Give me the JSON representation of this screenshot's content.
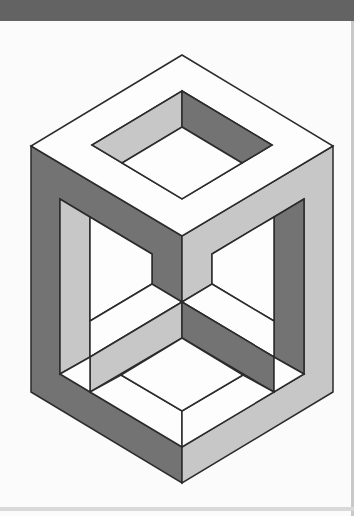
{
  "canvas": {
    "width": 354,
    "height": 516,
    "background": "#fbfbfb"
  },
  "top_bar": {
    "color": "#636363",
    "height": 21
  },
  "scan_artifacts": {
    "right_strip_color": "#c9c9c9",
    "bottom_strip_color": "#d9d9d9"
  },
  "palette": {
    "white": "#fdfdfd",
    "light": "#c7c7c7",
    "dark": "#737373",
    "stroke": "#2b2b2b",
    "stroke_width": 1.5
  },
  "shapes": [
    {
      "name": "left-outer-face",
      "fill": "dark",
      "points": [
        [
          31,
          146
        ],
        [
          182,
          236
        ],
        [
          182,
          302
        ],
        [
          152,
          284
        ],
        [
          152,
          254
        ],
        [
          60,
          199
        ],
        [
          60,
          374
        ],
        [
          182,
          447
        ],
        [
          182,
          483
        ],
        [
          31,
          392
        ]
      ]
    },
    {
      "name": "right-outer-face",
      "fill": "light",
      "points": [
        [
          333,
          146
        ],
        [
          182,
          236
        ],
        [
          182,
          302
        ],
        [
          212,
          284
        ],
        [
          212,
          254
        ],
        [
          304,
          199
        ],
        [
          304,
          374
        ],
        [
          182,
          447
        ],
        [
          182,
          483
        ],
        [
          333,
          392
        ]
      ]
    },
    {
      "name": "top-face-ring",
      "fill": "white",
      "points": [
        [
          182,
          55
        ],
        [
          333,
          146
        ],
        [
          182,
          236
        ],
        [
          31,
          146
        ]
      ],
      "hole": [
        [
          182,
          91
        ],
        [
          272,
          145
        ],
        [
          182,
          199
        ],
        [
          92,
          145
        ]
      ]
    },
    {
      "name": "hole-left-inner-wall",
      "fill": "light",
      "points": [
        [
          182,
          91
        ],
        [
          92,
          145
        ],
        [
          122,
          163
        ],
        [
          182,
          127
        ]
      ]
    },
    {
      "name": "hole-right-inner-wall",
      "fill": "dark",
      "points": [
        [
          182,
          91
        ],
        [
          272,
          145
        ],
        [
          242,
          163
        ],
        [
          182,
          127
        ]
      ]
    },
    {
      "name": "hole-floor-opening",
      "fill": "white",
      "points": [
        [
          182,
          127
        ],
        [
          242,
          163
        ],
        [
          182,
          199
        ],
        [
          122,
          163
        ]
      ]
    },
    {
      "name": "left-inner-wall",
      "fill": "light",
      "points": [
        [
          60,
          199
        ],
        [
          90,
          217
        ],
        [
          90,
          357
        ],
        [
          60,
          374
        ]
      ]
    },
    {
      "name": "right-inner-wall",
      "fill": "dark",
      "points": [
        [
          304,
          199
        ],
        [
          274,
          217
        ],
        [
          274,
          357
        ],
        [
          304,
          374
        ]
      ]
    },
    {
      "name": "left-window",
      "fill": "white",
      "points": [
        [
          90,
          217
        ],
        [
          152,
          254
        ],
        [
          152,
          284
        ],
        [
          90,
          321
        ]
      ]
    },
    {
      "name": "right-window",
      "fill": "white",
      "points": [
        [
          274,
          217
        ],
        [
          212,
          254
        ],
        [
          212,
          284
        ],
        [
          274,
          321
        ]
      ]
    },
    {
      "name": "left-mid-face",
      "fill": "white",
      "points": [
        [
          152,
          284
        ],
        [
          90,
          321
        ],
        [
          90,
          357
        ],
        [
          182,
          302
        ]
      ]
    },
    {
      "name": "right-mid-face",
      "fill": "white",
      "points": [
        [
          212,
          284
        ],
        [
          274,
          321
        ],
        [
          274,
          357
        ],
        [
          182,
          302
        ]
      ]
    },
    {
      "name": "left-lower-band",
      "fill": "light",
      "points": [
        [
          182,
          302
        ],
        [
          90,
          357
        ],
        [
          90,
          392
        ],
        [
          182,
          338
        ]
      ]
    },
    {
      "name": "right-lower-band",
      "fill": "dark",
      "points": [
        [
          182,
          302
        ],
        [
          274,
          357
        ],
        [
          274,
          392
        ],
        [
          182,
          338
        ]
      ]
    },
    {
      "name": "left-wedge",
      "fill": "white",
      "points": [
        [
          60,
          374
        ],
        [
          90,
          357
        ],
        [
          90,
          392
        ]
      ]
    },
    {
      "name": "right-wedge",
      "fill": "white",
      "points": [
        [
          304,
          374
        ],
        [
          274,
          357
        ],
        [
          274,
          392
        ]
      ]
    },
    {
      "name": "left-bottom-rim",
      "fill": "white",
      "points": [
        [
          121,
          375
        ],
        [
          182,
          411
        ],
        [
          182,
          447
        ],
        [
          90,
          392
        ]
      ]
    },
    {
      "name": "right-bottom-rim",
      "fill": "white",
      "points": [
        [
          243,
          375
        ],
        [
          182,
          411
        ],
        [
          182,
          447
        ],
        [
          274,
          392
        ]
      ]
    },
    {
      "name": "bottom-opening",
      "fill": "white",
      "points": [
        [
          182,
          338
        ],
        [
          121,
          375
        ],
        [
          182,
          411
        ],
        [
          243,
          375
        ]
      ]
    }
  ]
}
